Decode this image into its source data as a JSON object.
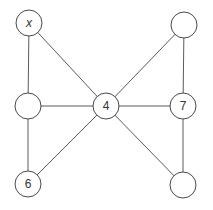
{
  "diagram": {
    "type": "graph",
    "nodes": [
      {
        "id": "tl",
        "label": "x",
        "x": 29,
        "y": 23
      },
      {
        "id": "tr",
        "label": "",
        "x": 184,
        "y": 25
      },
      {
        "id": "ml",
        "label": "",
        "x": 28,
        "y": 106
      },
      {
        "id": "c",
        "label": "4",
        "x": 106,
        "y": 106
      },
      {
        "id": "mr",
        "label": "7",
        "x": 183,
        "y": 106
      },
      {
        "id": "bl",
        "label": "6",
        "x": 28,
        "y": 184
      },
      {
        "id": "br",
        "label": "",
        "x": 183,
        "y": 185
      }
    ],
    "edges": [
      [
        "tl",
        "ml"
      ],
      [
        "tl",
        "c"
      ],
      [
        "ml",
        "c"
      ],
      [
        "ml",
        "bl"
      ],
      [
        "bl",
        "c"
      ],
      [
        "tr",
        "c"
      ],
      [
        "tr",
        "mr"
      ],
      [
        "c",
        "mr"
      ],
      [
        "c",
        "br"
      ],
      [
        "mr",
        "br"
      ]
    ]
  }
}
